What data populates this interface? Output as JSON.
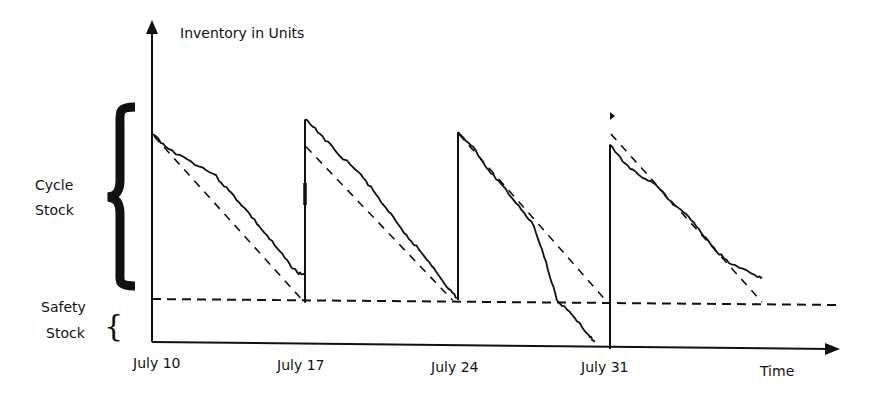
{
  "chart_data": {
    "type": "line",
    "title": "",
    "ylabel": "Inventory in Units",
    "xlabel": "Time",
    "x_ticks": [
      "July 10",
      "July 17",
      "July 24",
      "July 31"
    ],
    "annotations": {
      "cycle_stock": [
        "Cycle",
        "Stock"
      ],
      "safety_stock": [
        "Safety",
        "Stock"
      ]
    },
    "units": "relative inventory level (0 = zero stock, safety stock level = 1, ideal order-up-to level ≈ 5)",
    "safety_stock_level": 1.0,
    "series": [
      {
        "name": "Actual inventory",
        "style": "solid",
        "cycles": [
          {
            "start": "July 10",
            "points": [
              [
                0,
                4.95
              ],
              [
                0.1,
                4.6
              ],
              [
                0.25,
                4.3
              ],
              [
                0.4,
                4.0
              ],
              [
                0.5,
                3.6
              ],
              [
                0.6,
                3.2
              ],
              [
                0.7,
                2.75
              ],
              [
                0.8,
                2.3
              ],
              [
                0.9,
                1.85
              ],
              [
                0.95,
                1.65
              ],
              [
                1.0,
                1.6
              ]
            ]
          },
          {
            "start": "July 17",
            "points": [
              [
                0,
                5.3
              ],
              [
                0.1,
                4.95
              ],
              [
                0.2,
                4.55
              ],
              [
                0.35,
                4.05
              ],
              [
                0.45,
                3.6
              ],
              [
                0.55,
                3.1
              ],
              [
                0.65,
                2.6
              ],
              [
                0.75,
                2.2
              ],
              [
                0.85,
                1.75
              ],
              [
                0.95,
                1.25
              ],
              [
                1.0,
                1.05
              ]
            ]
          },
          {
            "start": "July 24",
            "points": [
              [
                0,
                5.0
              ],
              [
                0.1,
                4.65
              ],
              [
                0.2,
                4.1
              ],
              [
                0.3,
                3.7
              ],
              [
                0.4,
                3.25
              ],
              [
                0.5,
                2.75
              ],
              [
                0.58,
                1.9
              ],
              [
                0.65,
                1.0
              ],
              [
                0.75,
                0.65
              ],
              [
                0.85,
                0.2
              ],
              [
                0.9,
                0.0
              ]
            ]
          },
          {
            "start": "July 31",
            "points": [
              [
                0,
                4.7
              ],
              [
                0.1,
                4.25
              ],
              [
                0.2,
                3.95
              ],
              [
                0.3,
                3.75
              ],
              [
                0.4,
                3.35
              ],
              [
                0.5,
                3.05
              ],
              [
                0.6,
                2.6
              ],
              [
                0.7,
                2.15
              ],
              [
                0.8,
                1.85
              ],
              [
                0.95,
                1.6
              ],
              [
                1.0,
                1.55
              ]
            ]
          }
        ]
      },
      {
        "name": "Planned (average) depletion",
        "style": "dashed",
        "cycles": [
          {
            "start": "July 10",
            "from": 4.9,
            "to": 1.05
          },
          {
            "start": "July 17",
            "from": 4.65,
            "to": 1.0
          },
          {
            "start": "July 24",
            "from": 4.95,
            "to": 1.0
          },
          {
            "start": "July 31",
            "from": 4.95,
            "to": 0.95
          }
        ]
      },
      {
        "name": "Safety stock level",
        "style": "dashed-horizontal",
        "value": 1.0
      }
    ]
  }
}
